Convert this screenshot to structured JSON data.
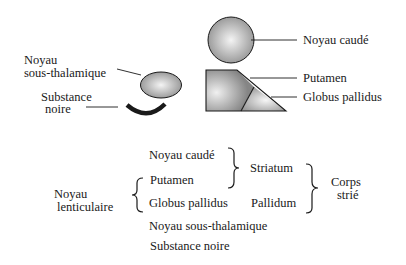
{
  "diagram": {
    "shapes": {
      "noyau_caude": {
        "label": "Noyau caudé"
      },
      "putamen": {
        "label": "Putamen"
      },
      "globus_pallidus": {
        "label": "Globus pallidus"
      },
      "noyau_sous_thalamique": {
        "label_line1": "Noyau",
        "label_line2": "sous-thalamique"
      },
      "substance_noire": {
        "label_line1": "Substance",
        "label_line2": "noire"
      }
    },
    "classification": {
      "items": [
        "Noyau caudé",
        "Putamen",
        "Globus pallidus",
        "Noyau sous-thalamique",
        "Substance noire"
      ],
      "striatum": "Striatum",
      "pallidum": "Pallidum",
      "corps_strie_line1": "Corps",
      "corps_strie_line2": "strié",
      "noyau_lenticulaire_line1": "Noyau",
      "noyau_lenticulaire_line2": "lenticulaire"
    },
    "colors": {
      "stroke": "#1a1a1a",
      "fill_dark": "#8c8c8c",
      "fill_light": "#f2f2f2"
    }
  }
}
